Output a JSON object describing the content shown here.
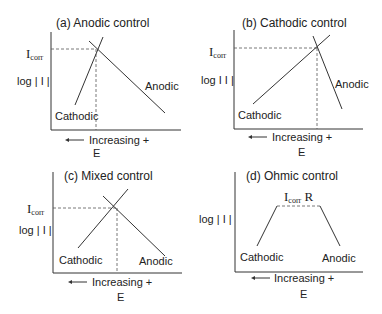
{
  "panels": [
    {
      "id": "a",
      "title": "(a)  Anodic control",
      "y_label": "log | I |",
      "icorr_label": "I",
      "icorr_sub": "corr",
      "cathodic_label": "Cathodic",
      "anodic_label": "Anodic",
      "x_arrow_label": "Increasing +",
      "x_axis_label": "E"
    },
    {
      "id": "b",
      "title": "(b)  Cathodic control",
      "y_label": "log  I I |",
      "icorr_label": "I",
      "icorr_sub": "corr",
      "cathodic_label": "Cathodic",
      "anodic_label": "Anodic",
      "x_arrow_label": "Increasing +",
      "x_axis_label": "E"
    },
    {
      "id": "c",
      "title": "(c)  Mixed control",
      "y_label": "log | I |",
      "icorr_label": "I",
      "icorr_sub": "corr",
      "cathodic_label": "Cathodic",
      "anodic_label": "Anodic",
      "x_arrow_label": "Increasing +",
      "x_axis_label": "E"
    },
    {
      "id": "d",
      "title": "(d)  Ohmic control",
      "y_label": "log | I |",
      "plateau_label_main": "I",
      "plateau_label_sub": "corr",
      "plateau_label_suffix": " R",
      "cathodic_label": "Cathodic",
      "anodic_label": "Anodic",
      "x_arrow_label": "Increasing +",
      "x_axis_label": "E"
    }
  ],
  "colors": {
    "line": "#333333",
    "dash": "#555555",
    "text": "#222222"
  }
}
